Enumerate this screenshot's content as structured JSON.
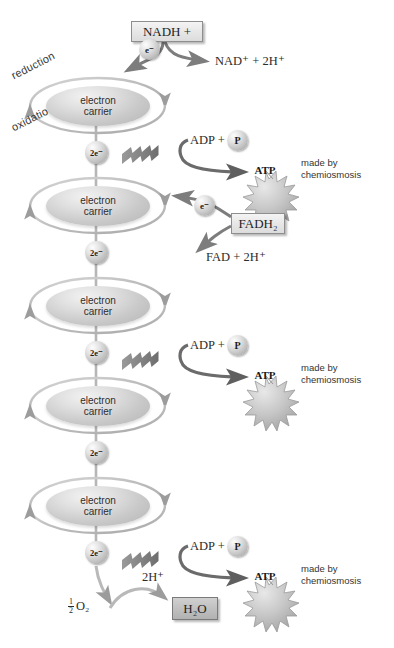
{
  "diagram": {
    "colors": {
      "arrow_gray": "#8c8c8c",
      "arrow_dark": "#5f5f5f",
      "shape_gray": "#c0c0c0",
      "text": "#2b2b2b",
      "box_fill": "#e9e9e9",
      "shaded_box_fill": "#bdbdbd"
    },
    "process_labels": {
      "reduction": "reduction",
      "oxidation": "oxidation"
    },
    "inputs": [
      {
        "id": "nadh",
        "label": "NADH +",
        "electron_label": "e⁻"
      },
      {
        "id": "fadh2",
        "label": "FADH₂",
        "electron_label": "e⁻"
      }
    ],
    "products": [
      {
        "id": "nad",
        "label": "NAD⁺ + 2H⁺"
      },
      {
        "id": "fad",
        "label": "FAD + 2H⁺"
      }
    ],
    "carriers": [
      {
        "index": 1,
        "line1": "electron",
        "line2": "carrier"
      },
      {
        "index": 2,
        "line1": "electron",
        "line2": "carrier"
      },
      {
        "index": 3,
        "line1": "electron",
        "line2": "carrier"
      },
      {
        "index": 4,
        "line1": "electron",
        "line2": "carrier"
      },
      {
        "index": 5,
        "line1": "electron",
        "line2": "carrier"
      }
    ],
    "electron_pairs": [
      {
        "index": 1,
        "label": "2e⁻"
      },
      {
        "index": 2,
        "label": "2e⁻"
      },
      {
        "index": 3,
        "label": "2e⁻"
      },
      {
        "index": 4,
        "label": "2e⁻"
      },
      {
        "index": 5,
        "label": "2e⁻"
      }
    ],
    "atp_sites": [
      {
        "index": 1,
        "adp_label": "ADP +",
        "phosphate_label": "P",
        "atp_label": "ATP",
        "note_line1": "made by",
        "note_line2": "chemiosmosis"
      },
      {
        "index": 2,
        "adp_label": "ADP +",
        "phosphate_label": "P",
        "atp_label": "ATP",
        "note_line1": "made by",
        "note_line2": "chemiosmosis"
      },
      {
        "index": 3,
        "adp_label": "ADP +",
        "phosphate_label": "P",
        "atp_label": "ATP",
        "note_line1": "made by",
        "note_line2": "chemiosmosis"
      }
    ],
    "terminal": {
      "protons_label": "2H⁺",
      "oxygen_numerator": "1",
      "oxygen_denominator": "2",
      "oxygen_label": "O₂",
      "water_label": "H₂O"
    }
  }
}
